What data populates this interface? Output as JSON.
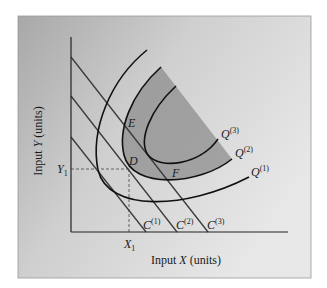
{
  "figure": {
    "type": "isoquant-isocost diagram",
    "background": {
      "panel_color_dark": "#a9a9a9",
      "panel_color_light": "#e6e6e6",
      "shaded_region": "#8f8f8f"
    },
    "axes": {
      "x_label_prefix": "Input ",
      "x_label_var": "X",
      "x_label_suffix": " (units)",
      "y_label_prefix": "Input ",
      "y_label_var": "Y",
      "y_label_suffix": " (units)",
      "x_tick_var": "X",
      "x_tick_sub": "1",
      "y_tick_var": "Y",
      "y_tick_sub": "1"
    },
    "isoquants": [
      {
        "name": "Q",
        "sup": "(1)"
      },
      {
        "name": "Q",
        "sup": "(2)"
      },
      {
        "name": "Q",
        "sup": "(3)"
      }
    ],
    "isocosts": [
      {
        "name": "C",
        "sup": "(1)"
      },
      {
        "name": "C",
        "sup": "(2)"
      },
      {
        "name": "C",
        "sup": "(3)"
      }
    ],
    "points": [
      {
        "label": "E"
      },
      {
        "label": "D"
      },
      {
        "label": "F"
      }
    ]
  }
}
